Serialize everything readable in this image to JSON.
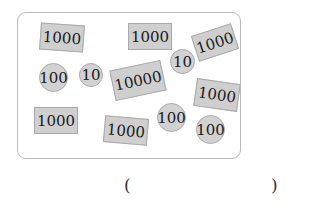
{
  "items": [
    {
      "kind": "note",
      "value": "1000",
      "x": 40,
      "y": 24,
      "w": 44,
      "h": 27,
      "rot": 4
    },
    {
      "kind": "note",
      "value": "1000",
      "x": 128,
      "y": 23,
      "w": 44,
      "h": 27,
      "rot": 0
    },
    {
      "kind": "note",
      "value": "1000",
      "x": 194,
      "y": 29,
      "w": 42,
      "h": 27,
      "rot": -18
    },
    {
      "kind": "coin",
      "value": "100",
      "x": 39,
      "y": 63,
      "w": 29,
      "h": 29,
      "rot": 0
    },
    {
      "kind": "coin",
      "value": "10",
      "x": 79,
      "y": 63,
      "w": 24,
      "h": 24,
      "rot": 0
    },
    {
      "kind": "note",
      "value": "10000",
      "x": 112,
      "y": 65,
      "w": 52,
      "h": 31,
      "rot": -12
    },
    {
      "kind": "coin",
      "value": "10",
      "x": 170,
      "y": 49,
      "w": 25,
      "h": 25,
      "rot": 0
    },
    {
      "kind": "note",
      "value": "1000",
      "x": 195,
      "y": 81,
      "w": 44,
      "h": 28,
      "rot": 8
    },
    {
      "kind": "note",
      "value": "1000",
      "x": 34,
      "y": 107,
      "w": 44,
      "h": 27,
      "rot": 0
    },
    {
      "kind": "note",
      "value": "1000",
      "x": 104,
      "y": 117,
      "w": 44,
      "h": 27,
      "rot": 5
    },
    {
      "kind": "coin",
      "value": "100",
      "x": 157,
      "y": 103,
      "w": 29,
      "h": 29,
      "rot": 0
    },
    {
      "kind": "coin",
      "value": "100",
      "x": 196,
      "y": 115,
      "w": 29,
      "h": 29,
      "rot": 0
    }
  ],
  "answer": {
    "open": "(",
    "close": ")",
    "value": ""
  }
}
